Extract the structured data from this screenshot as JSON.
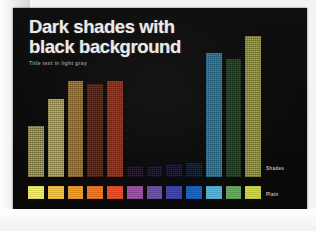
{
  "slide": {
    "background_color": "#0a0a0a",
    "title_line_1": "Dark shades with",
    "title_line_2": "black background",
    "subtitle": "Title text in light gray",
    "title_color": "#e9e9e7",
    "subtitle_color": "#8d8d8a"
  },
  "legend": {
    "shades_label": "Shades",
    "plain_label": "Plain",
    "label_color": "#b9b9b5"
  },
  "chart_data": {
    "type": "bar",
    "title": "Dark shades with black background",
    "subtitle": "Title text in light gray",
    "xlabel": "",
    "ylabel": "",
    "grid": false,
    "legend_position": "right",
    "categories": [
      "1",
      "2",
      "3",
      "4",
      "5",
      "6",
      "7",
      "8",
      "9",
      "10",
      "11",
      "12"
    ],
    "series": [
      {
        "name": "Shades",
        "values": [
          36,
          55,
          68,
          66,
          68,
          8,
          8,
          9,
          10,
          88,
          84,
          100
        ],
        "colors": [
          "#a39a55",
          "#b5a95a",
          "#a87a30",
          "#5e2212",
          "#9c2f19",
          "#1d0d23",
          "#140f26",
          "#101032",
          "#07182c",
          "#2a7da3",
          "#1e4220",
          "#9a9c42"
        ]
      },
      {
        "name": "Plain",
        "values": [
          100,
          100,
          100,
          100,
          100,
          100,
          100,
          100,
          100,
          100,
          100,
          100
        ],
        "colors": [
          "#f4ef5e",
          "#f5c43c",
          "#f39a22",
          "#f2731c",
          "#ee4a20",
          "#9b4fa0",
          "#6b4ba8",
          "#3c3fae",
          "#0f62c4",
          "#4fb4dd",
          "#63a85a",
          "#cfd840"
        ]
      }
    ],
    "ylim": [
      0,
      100
    ]
  }
}
